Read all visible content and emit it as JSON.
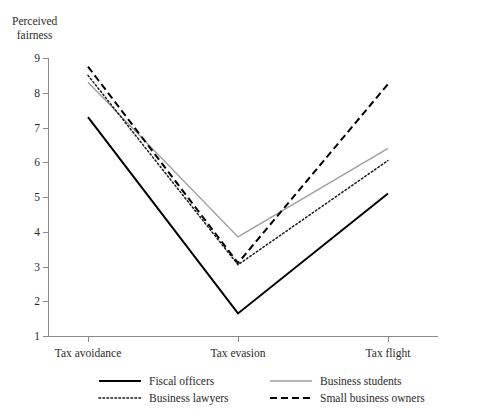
{
  "chart_data": {
    "type": "line",
    "title": "",
    "ylabel": "Perceived\nfairness",
    "xlabel": "",
    "categories": [
      "Tax avoidance",
      "Tax evasion",
      "Tax flight"
    ],
    "ylim": [
      1,
      9
    ],
    "yticks": [
      1,
      2,
      3,
      4,
      5,
      6,
      7,
      8,
      9
    ],
    "grid": false,
    "legend_position": "bottom",
    "series": [
      {
        "name": "Fiscal officers",
        "values": [
          7.3,
          1.65,
          5.1
        ],
        "style": "solid",
        "color": "#000000",
        "width": 2.0
      },
      {
        "name": "Business students",
        "values": [
          8.3,
          3.85,
          6.4
        ],
        "style": "solid",
        "color": "#9e9e9e",
        "width": 1.4
      },
      {
        "name": "Business lawyers",
        "values": [
          8.5,
          3.05,
          6.05
        ],
        "style": "dotted",
        "color": "#1a1a1a",
        "width": 1.5
      },
      {
        "name": "Small business owners",
        "values": [
          8.75,
          3.1,
          8.25
        ],
        "style": "dashed",
        "color": "#000000",
        "width": 2.0
      }
    ]
  },
  "axis": {
    "y_title_line1": "Perceived",
    "y_title_line2": "fairness",
    "tick_labels": [
      "1",
      "2",
      "3",
      "4",
      "5",
      "6",
      "7",
      "8",
      "9"
    ]
  },
  "legend": {
    "items": [
      {
        "label": "Fiscal officers",
        "style": "solid",
        "color": "#000000"
      },
      {
        "label": "Business students",
        "style": "solid",
        "color": "#9e9e9e"
      },
      {
        "label": "Business lawyers",
        "style": "dotted",
        "color": "#1a1a1a"
      },
      {
        "label": "Small business owners",
        "style": "dashed",
        "color": "#000000"
      }
    ]
  }
}
